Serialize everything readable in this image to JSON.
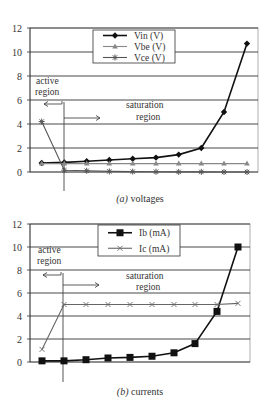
{
  "chart_data": [
    {
      "type": "line",
      "title": "(a) voltages",
      "caption_prefix": "(a)",
      "caption_text": " voltages",
      "xlabel": "",
      "ylabel": "",
      "ylim": [
        0,
        12
      ],
      "yticks": [
        "0",
        "2",
        "4",
        "6",
        "8",
        "10",
        "12"
      ],
      "grid": true,
      "legend_position": "top-center",
      "x": [
        1,
        2,
        3,
        4,
        5,
        6,
        7,
        8,
        9,
        10
      ],
      "series": [
        {
          "name": "Vin (V)",
          "marker": "diamond",
          "color": "#111111",
          "values": [
            0.75,
            0.8,
            0.9,
            1.0,
            1.1,
            1.2,
            1.45,
            2.0,
            5.0,
            10.7
          ]
        },
        {
          "name": "Vbe (V)",
          "marker": "triangle",
          "color": "#888888",
          "values": [
            0.7,
            0.7,
            0.7,
            0.7,
            0.7,
            0.7,
            0.7,
            0.7,
            0.7,
            0.7
          ]
        },
        {
          "name": "Vce (V)",
          "marker": "asterisk",
          "color": "#555555",
          "values": [
            4.2,
            0.15,
            0.1,
            0.05,
            0.03,
            0.02,
            0.01,
            0.01,
            0.0,
            0.0
          ]
        }
      ],
      "annotations": {
        "active": [
          "active",
          "region"
        ],
        "saturation": [
          "saturation",
          "region"
        ]
      }
    },
    {
      "type": "line",
      "title": "(b) currents",
      "caption_prefix": "(b)",
      "caption_text": " currents",
      "xlabel": "",
      "ylabel": "",
      "ylim": [
        0,
        12
      ],
      "yticks": [
        "0",
        "2",
        "4",
        "6",
        "8",
        "10",
        "12"
      ],
      "grid": true,
      "legend_position": "top-center",
      "x": [
        1,
        2,
        3,
        4,
        5,
        6,
        7,
        8,
        9,
        10
      ],
      "series": [
        {
          "name": "Ib (mA)",
          "marker": "square",
          "color": "#111111",
          "values": [
            0.1,
            0.1,
            0.2,
            0.35,
            0.4,
            0.5,
            0.8,
            1.6,
            4.4,
            10.0
          ]
        },
        {
          "name": "Ic (mA)",
          "marker": "x",
          "color": "#666666",
          "values": [
            1.1,
            5.0,
            5.0,
            5.0,
            5.0,
            5.0,
            5.0,
            5.0,
            5.0,
            5.1
          ]
        }
      ],
      "annotations": {
        "active": [
          "active",
          "region"
        ],
        "saturation": [
          "saturation",
          "region"
        ]
      }
    }
  ]
}
